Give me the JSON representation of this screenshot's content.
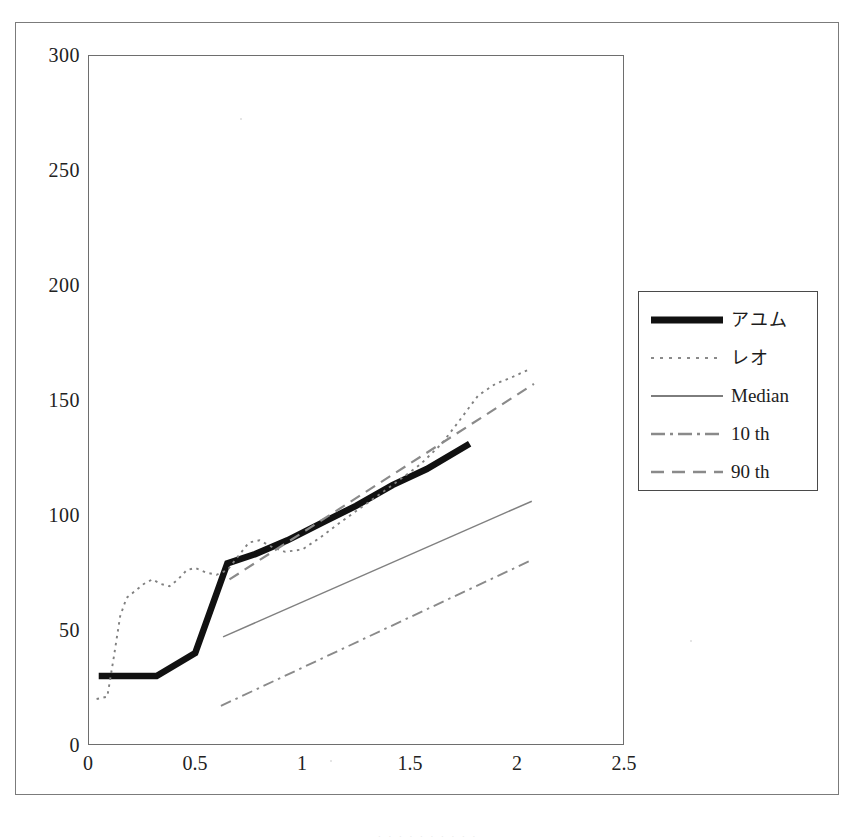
{
  "figure": {
    "background_color": "#ffffff",
    "frame_color": "#7b7b7b",
    "axis_color": "#6e6e6e"
  },
  "axes": {
    "y_ticks": [
      "0",
      "50",
      "100",
      "150",
      "200",
      "250",
      "300"
    ],
    "x_ticks": [
      "0",
      "0.5",
      "1",
      "1.5",
      "2",
      "2.5"
    ],
    "ylim": [
      0,
      300
    ],
    "xlim": [
      0,
      2.5
    ],
    "xlabel": "",
    "ylabel": ""
  },
  "legend": {
    "position": "right",
    "items": [
      {
        "label": "アユム",
        "style": "thick-solid",
        "color": "#111111",
        "width": 6,
        "japanese": true
      },
      {
        "label": "レオ",
        "style": "dotted",
        "color": "#808080",
        "width": 1.6,
        "japanese": true
      },
      {
        "label": "Median",
        "style": "solid",
        "color": "#808080",
        "width": 1.3,
        "japanese": false
      },
      {
        "label": "10 th",
        "style": "dash-dot",
        "color": "#8a8a8a",
        "width": 1.6,
        "japanese": false
      },
      {
        "label": "90 th",
        "style": "dashed",
        "color": "#8a8a8a",
        "width": 1.8,
        "japanese": false
      }
    ]
  },
  "caption_remnant": ". . .  . . . .   . . .",
  "chart_data": {
    "type": "line",
    "title": "",
    "xlabel": "",
    "ylabel": "",
    "xlim": [
      0,
      2.5
    ],
    "ylim": [
      0,
      300
    ],
    "grid": false,
    "legend_position": "right",
    "series": [
      {
        "name": "アユム",
        "style": "thick-solid",
        "color": "#111111",
        "points": [
          [
            0.05,
            30
          ],
          [
            0.32,
            30
          ],
          [
            0.5,
            40
          ],
          [
            0.65,
            79
          ],
          [
            0.78,
            83
          ],
          [
            0.93,
            89
          ],
          [
            1.1,
            97
          ],
          [
            1.25,
            104
          ],
          [
            1.42,
            113
          ],
          [
            1.58,
            120
          ],
          [
            1.78,
            131
          ]
        ]
      },
      {
        "name": "レオ",
        "style": "dotted",
        "color": "#808080",
        "points": [
          [
            0.04,
            20
          ],
          [
            0.09,
            21
          ],
          [
            0.12,
            38
          ],
          [
            0.15,
            56
          ],
          [
            0.18,
            64
          ],
          [
            0.22,
            67
          ],
          [
            0.26,
            70
          ],
          [
            0.3,
            72
          ],
          [
            0.34,
            70
          ],
          [
            0.38,
            69
          ],
          [
            0.42,
            72
          ],
          [
            0.46,
            76
          ],
          [
            0.5,
            77
          ],
          [
            0.55,
            75
          ],
          [
            0.6,
            74
          ],
          [
            0.65,
            76
          ],
          [
            0.7,
            82
          ],
          [
            0.75,
            88
          ],
          [
            0.8,
            89
          ],
          [
            0.86,
            86
          ],
          [
            0.92,
            84
          ],
          [
            1.0,
            85
          ],
          [
            1.08,
            90
          ],
          [
            1.18,
            97
          ],
          [
            1.3,
            105
          ],
          [
            1.42,
            113
          ],
          [
            1.55,
            122
          ],
          [
            1.65,
            131
          ],
          [
            1.74,
            142
          ],
          [
            1.82,
            152
          ],
          [
            1.9,
            157
          ],
          [
            1.98,
            160
          ],
          [
            2.05,
            163
          ]
        ]
      },
      {
        "name": "Median",
        "style": "solid",
        "color": "#808080",
        "points": [
          [
            0.63,
            47
          ],
          [
            2.07,
            106
          ]
        ]
      },
      {
        "name": "10 th",
        "style": "dash-dot",
        "color": "#8a8a8a",
        "points": [
          [
            0.62,
            17
          ],
          [
            2.06,
            80
          ]
        ]
      },
      {
        "name": "90 th",
        "style": "dashed",
        "color": "#8a8a8a",
        "points": [
          [
            0.66,
            72
          ],
          [
            2.08,
            157
          ]
        ]
      }
    ]
  }
}
